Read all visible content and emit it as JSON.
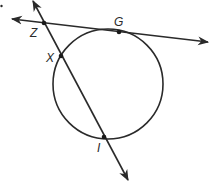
{
  "diagram": {
    "type": "geometry-circle-tangent-secant",
    "colors": {
      "stroke": "#2a2a2a",
      "background": "#ffffff"
    },
    "circle": {
      "cx": 108,
      "cy": 84,
      "r": 55
    },
    "tangent_line": {
      "from": [
        12,
        19
      ],
      "to": [
        208,
        42
      ],
      "through": [
        "Z",
        "G"
      ]
    },
    "secant_line": {
      "from": [
        33,
        1
      ],
      "to": [
        128,
        180
      ],
      "through": [
        "Z",
        "X",
        "I"
      ]
    },
    "points": [
      {
        "name": "Z",
        "label": "Z",
        "x": 44,
        "y": 23,
        "label_x": 30,
        "label_y": 36
      },
      {
        "name": "G",
        "label": "G",
        "x": 119,
        "y": 32,
        "label_x": 114,
        "label_y": 26
      },
      {
        "name": "X",
        "label": "X",
        "x": 61,
        "y": 56,
        "label_x": 46,
        "label_y": 62
      },
      {
        "name": "I",
        "label": "I",
        "x": 104,
        "y": 137,
        "label_x": 97,
        "label_y": 152
      }
    ],
    "stray_mark": {
      "x": 1,
      "y": 6
    }
  }
}
